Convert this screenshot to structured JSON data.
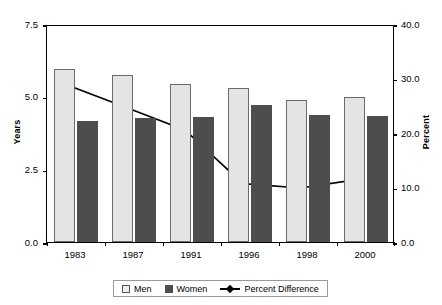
{
  "chart_data": {
    "type": "bar",
    "title": "",
    "xlabel": "",
    "ylabel": "Years",
    "y2label": "Percent",
    "categories": [
      "1983",
      "1987",
      "1991",
      "1996",
      "1998",
      "2000"
    ],
    "series": [
      {
        "name": "Men",
        "axis": "left",
        "type": "bar",
        "values": [
          5.95,
          5.75,
          5.45,
          5.3,
          4.9,
          5.0
        ]
      },
      {
        "name": "Women",
        "axis": "left",
        "type": "bar",
        "values": [
          4.15,
          4.28,
          4.3,
          4.72,
          4.37,
          4.35
        ]
      },
      {
        "name": "Percent Difference",
        "axis": "right",
        "type": "line",
        "values": [
          28.9,
          24.8,
          20.7,
          10.8,
          10.0,
          11.6
        ]
      }
    ],
    "ylim": [
      0.0,
      7.5
    ],
    "y2lim": [
      0.0,
      40.0
    ],
    "yticks": [
      "7.5",
      "5.0",
      "2.5",
      "0.0"
    ],
    "ytick_values": [
      7.5,
      5.0,
      2.5,
      0.0
    ],
    "y2ticks": [
      "40.0",
      "30.0",
      "20.0",
      "10.0",
      "0.0"
    ],
    "y2tick_values": [
      40.0,
      30.0,
      20.0,
      10.0,
      0.0
    ],
    "grid": false,
    "legend_position": "bottom",
    "legend": [
      "Men",
      "Women",
      "Percent Difference"
    ],
    "colors": {
      "men": "#e4e4e4",
      "men_border": "#6b6b6b",
      "women": "#4d4d4d",
      "line": "#000000",
      "axis": "#000000",
      "background": "#ffffff"
    }
  }
}
